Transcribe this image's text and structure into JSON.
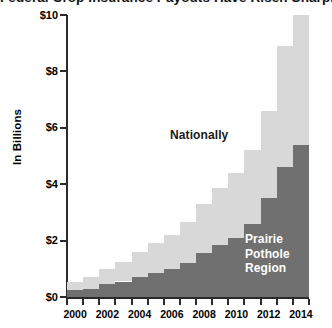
{
  "chart_data": {
    "type": "bar",
    "subtype": "stacked-bar",
    "title": "Federal Crop Insurance Payouts Have Risen Sharply since 2000",
    "xlabel": "",
    "ylabel": "In Billions",
    "ylim": [
      0,
      10
    ],
    "ytick_values": [
      0,
      2,
      4,
      6,
      8,
      10
    ],
    "ytick_labels": [
      "$0",
      "$2",
      "$4",
      "$6",
      "$8",
      "$10"
    ],
    "grid": false,
    "legend_position": "inline-annotation",
    "categories": [
      "2000",
      "2001",
      "2002",
      "2003",
      "2004",
      "2005",
      "2006",
      "2007",
      "2008",
      "2009",
      "2010",
      "2011",
      "2012",
      "2013",
      "2014"
    ],
    "xtick_labels": [
      "2000",
      "2002",
      "2004",
      "2006",
      "2008",
      "2010",
      "2012",
      "2014"
    ],
    "xtick_all_years": [
      "2000",
      "2001",
      "2002",
      "2003",
      "2004",
      "2005",
      "2006",
      "2007",
      "2008",
      "2009",
      "2010",
      "2011",
      "2012",
      "2013",
      "2014"
    ],
    "series": [
      {
        "name": "Prairie Pothole Region",
        "color": "#707070",
        "stack_order": 0,
        "values": [
          0.25,
          0.3,
          0.45,
          0.55,
          0.7,
          0.85,
          1.0,
          1.2,
          1.55,
          1.85,
          2.1,
          2.6,
          3.5,
          4.6,
          5.4
        ]
      },
      {
        "name": "Nationally",
        "color": "#d8d8d8",
        "stack_order": 1,
        "note": "light segment is the remainder of the national total above the Prairie Pothole Region",
        "values": [
          0.3,
          0.4,
          0.55,
          0.7,
          0.9,
          1.05,
          1.2,
          1.45,
          1.75,
          2.0,
          2.3,
          2.6,
          3.1,
          4.3,
          4.6
        ]
      }
    ],
    "totals_nationally": [
      0.55,
      0.7,
      1.0,
      1.25,
      1.6,
      1.9,
      2.2,
      2.65,
      3.3,
      3.85,
      4.4,
      5.2,
      6.6,
      8.9,
      10.0
    ],
    "annotations": [
      {
        "text": "Nationally",
        "target_series": "Nationally",
        "color": "#1a1a1a"
      },
      {
        "text": "Prairie\nPothole\nRegion",
        "target_series": "Prairie Pothole Region",
        "color": "#ffffff"
      }
    ]
  },
  "axes": {
    "y_title": "In Billions",
    "y_labels": [
      {
        "value": 10,
        "text": "$10"
      },
      {
        "value": 8,
        "text": "$8"
      },
      {
        "value": 6,
        "text": "$6"
      },
      {
        "value": 4,
        "text": "$4"
      },
      {
        "value": 2,
        "text": "$2"
      },
      {
        "value": 0,
        "text": "$0"
      }
    ],
    "x_labels": [
      {
        "year": 2000,
        "text": "2000"
      },
      {
        "year": 2002,
        "text": "2002"
      },
      {
        "year": 2004,
        "text": "2004"
      },
      {
        "year": 2006,
        "text": "2006"
      },
      {
        "year": 2008,
        "text": "2008"
      },
      {
        "year": 2010,
        "text": "2010"
      },
      {
        "year": 2012,
        "text": "2012"
      },
      {
        "year": 2014,
        "text": "2014"
      }
    ]
  },
  "labels": {
    "nationally": "Nationally",
    "ppr_line1": "Prairie",
    "ppr_line2": "Pothole",
    "ppr_line3": "Region"
  },
  "title": {
    "text": "Federal Crop Insurance Payouts Have Risen Sharply since 2000"
  },
  "colors": {
    "series_light": "#d8d8d8",
    "series_dark": "#707070",
    "axis": "#2b2b2b",
    "text": "#000000",
    "background": "#ffffff"
  }
}
